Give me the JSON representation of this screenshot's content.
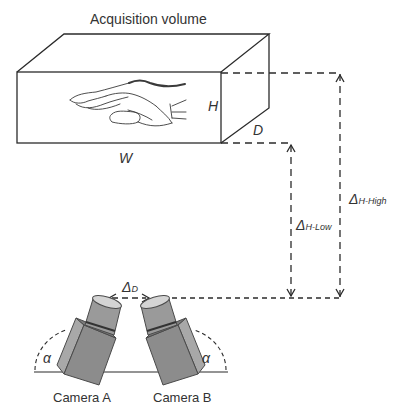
{
  "diagram": {
    "title": "Acquisition volume",
    "dimensions": {
      "width_label": "W",
      "height_label": "H",
      "depth_label": "D"
    },
    "distances": {
      "high": {
        "symbol": "Δ",
        "subscript": "H-High"
      },
      "low": {
        "symbol": "Δ",
        "subscript": "H-Low"
      },
      "cam_sep": {
        "symbol": "Δ",
        "subscript": "D"
      }
    },
    "angle_label": "α",
    "cameras": [
      {
        "label": "Camera A"
      },
      {
        "label": "Camera B"
      }
    ],
    "colors": {
      "line": "#2b2b2b",
      "camera_front": "#8c8c8c",
      "camera_side": "#a8a8a8",
      "camera_lens": "#9a9a9a",
      "lens_face": "#d4d4d4",
      "camera_outline": "#4a4a4a"
    }
  }
}
